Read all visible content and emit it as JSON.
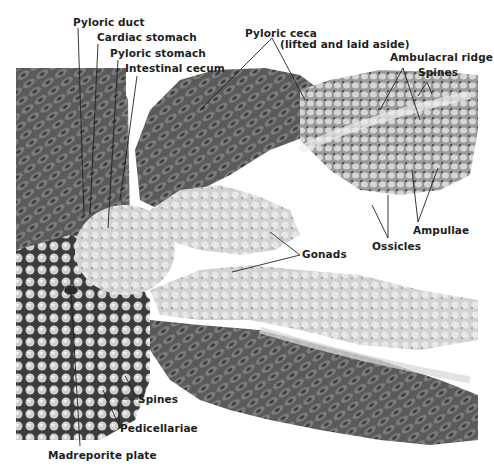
{
  "figure": {
    "style": "grayscale photograph with leader-line labels",
    "colors": {
      "background": "#ffffff",
      "label_text": "#1e1e1e",
      "leader_line": "#222222",
      "tissue_dark": "#3a3a3a",
      "tissue_mid": "#8a8a8a",
      "tissue_light": "#d8d8d8"
    }
  },
  "labels": {
    "pyloric_duct": "Pyloric duct",
    "cardiac_stomach": "Cardiac stomach",
    "pyloric_stomach": "Pyloric stomach",
    "intestinal_cecum": "Intestinal cecum",
    "pyloric_ceca": "Pyloric ceca",
    "pyloric_ceca_note": "(lifted and laid aside)",
    "ambulacral_ridge": "Ambulacral ridge",
    "spines_top": "Spines",
    "ampullae": "Ampullae",
    "ossicles": "Ossicles",
    "gonads": "Gonads",
    "spines_bottom": "Spines",
    "pedicellariae": "Pedicellariae",
    "madreporite_plate": "Madreporite plate"
  }
}
